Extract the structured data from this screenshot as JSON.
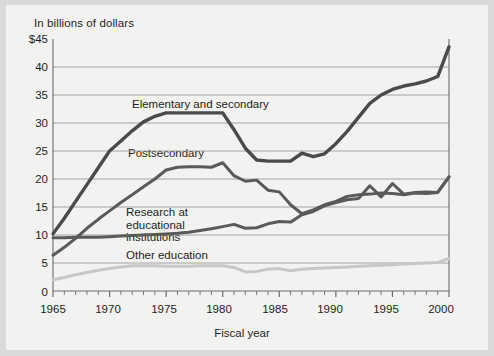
{
  "figure": {
    "background_color": "#d9d9d9",
    "panel_color": "#f2f2f1"
  },
  "chart_data": {
    "type": "line",
    "title": "",
    "subtitle": "",
    "unit_label": "In billions of dollars",
    "xlabel": "Fiscal year",
    "ylabel": "",
    "xlim": [
      1965,
      2000
    ],
    "ylim": [
      0,
      45
    ],
    "grid": true,
    "grid_axis": "y",
    "legend_position": "inline-annotations",
    "ytick_labels": [
      "$45",
      "40",
      "35",
      "30",
      "25",
      "20",
      "15",
      "10",
      "5",
      "0"
    ],
    "ytick_values": [
      45,
      40,
      35,
      30,
      25,
      20,
      15,
      10,
      5,
      0
    ],
    "xtick_labels": [
      "1965",
      "1970",
      "1975",
      "1980",
      "1985",
      "1990",
      "1995",
      "2000"
    ],
    "xtick_values": [
      1965,
      1970,
      1975,
      1980,
      1985,
      1990,
      1995,
      2000
    ],
    "minor_tick_interval": 1,
    "x": [
      1965,
      1966,
      1967,
      1968,
      1969,
      1970,
      1971,
      1972,
      1973,
      1974,
      1975,
      1976,
      1977,
      1978,
      1979,
      1980,
      1981,
      1982,
      1983,
      1984,
      1985,
      1986,
      1987,
      1988,
      1989,
      1990,
      1991,
      1992,
      1993,
      1994,
      1995,
      1996,
      1997,
      1998,
      1999,
      2000
    ],
    "series": [
      {
        "name": "Elementary and secondary",
        "color": "#4a4a4a",
        "width": 3.4,
        "values": [
          10.2,
          13.0,
          16.0,
          19.0,
          22.0,
          25.0,
          26.8,
          28.6,
          30.2,
          31.2,
          31.8,
          31.8,
          31.8,
          31.8,
          31.8,
          31.8,
          28.8,
          25.5,
          23.4,
          23.2,
          23.2,
          23.2,
          24.6,
          24.0,
          24.5,
          26.3,
          28.5,
          31.0,
          33.5,
          35.0,
          36.0,
          36.6,
          37.0,
          37.5,
          38.3,
          43.6
        ]
      },
      {
        "name": "Postsecondary",
        "color": "#5a5a5a",
        "width": 3.0,
        "values": [
          6.4,
          7.8,
          9.4,
          11.2,
          12.8,
          14.3,
          15.8,
          17.2,
          18.6,
          20.0,
          21.6,
          22.1,
          22.2,
          22.2,
          22.1,
          22.9,
          20.6,
          19.6,
          19.8,
          18.0,
          17.7,
          15.4,
          13.8,
          14.5,
          15.4,
          16.0,
          16.9,
          17.2,
          17.3,
          17.5,
          17.4,
          17.2,
          17.5,
          17.4,
          17.6,
          20.4
        ]
      },
      {
        "name": "Research at educational institutions",
        "color": "#5a5a5a",
        "width": 3.0,
        "values": [
          9.5,
          9.5,
          9.6,
          9.6,
          9.6,
          9.7,
          9.8,
          9.9,
          10.0,
          10.1,
          10.2,
          10.3,
          10.5,
          10.8,
          11.1,
          11.5,
          11.9,
          11.2,
          11.3,
          12.0,
          12.4,
          12.3,
          13.6,
          14.2,
          15.2,
          15.8,
          16.3,
          16.5,
          18.8,
          16.8,
          19.2,
          17.3,
          17.6,
          17.7,
          17.6,
          20.4
        ]
      },
      {
        "name": "Other education",
        "color": "#c7c7c7",
        "width": 3.0,
        "values": [
          2.0,
          2.4,
          2.9,
          3.3,
          3.7,
          4.0,
          4.3,
          4.5,
          4.5,
          4.5,
          4.4,
          4.4,
          4.4,
          4.5,
          4.5,
          4.5,
          4.2,
          3.4,
          3.5,
          3.9,
          4.0,
          3.6,
          3.9,
          4.0,
          4.1,
          4.2,
          4.3,
          4.4,
          4.5,
          4.6,
          4.7,
          4.8,
          4.9,
          5.0,
          5.1,
          5.8
        ]
      }
    ],
    "annotations": [
      {
        "name": "elementary-and-secondary-label",
        "text": "Elementary and secondary",
        "x_px": 132,
        "y_px": 99
      },
      {
        "name": "postsecondary-label",
        "text": "Postsecondary",
        "x_px": 128,
        "y_px": 148
      },
      {
        "name": "research-at-educational-institutions-label",
        "text": "Research at educational\ninstitutions",
        "x_px": 126,
        "y_px": 207
      },
      {
        "name": "other-education-label",
        "text": "Other education",
        "x_px": 126,
        "y_px": 250
      }
    ]
  }
}
